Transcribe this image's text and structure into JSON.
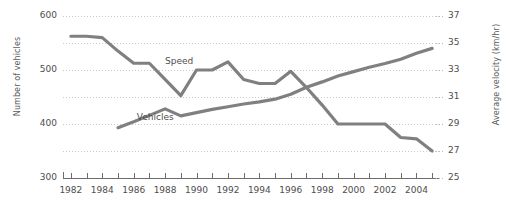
{
  "chart_data": {
    "type": "line",
    "title": "",
    "xlabel": "",
    "ylabel": "Number of vehicles",
    "y2label": "Average velocity (km/hr)",
    "grid": true,
    "legend_position": "inline-labels",
    "xlim": [
      1981.5,
      2005.5
    ],
    "ylim": [
      300,
      600
    ],
    "y2lim": [
      25,
      37
    ],
    "x_tick_step": 1,
    "x_label_step": 2,
    "y_ticks": [
      300,
      400,
      500,
      600
    ],
    "y_gridlines": [
      350,
      400,
      450,
      500,
      550,
      600
    ],
    "y2_ticks": [
      25,
      27,
      29,
      31,
      33,
      35,
      37
    ],
    "x": [
      1982,
      1983,
      1984,
      1985,
      1986,
      1987,
      1988,
      1989,
      1990,
      1991,
      1992,
      1993,
      1994,
      1995,
      1996,
      1997,
      1998,
      1999,
      2000,
      2001,
      2002,
      2003,
      2004,
      2005
    ],
    "x_tick_labels": [
      "1982",
      "1984",
      "1986",
      "1988",
      "1990",
      "1992",
      "1994",
      "1996",
      "1998",
      "2000",
      "2002",
      "2004"
    ],
    "series": [
      {
        "name": "Vehicles",
        "axis": "left",
        "unit": "number of vehicles",
        "color": "#808080",
        "label_text": "Vehicles",
        "x": [
          1985,
          1986,
          1987,
          1988,
          1989,
          1990,
          1991,
          1992,
          1993,
          1994,
          1995,
          1996,
          1997,
          1998,
          1999,
          2000,
          2001,
          2002,
          2003,
          2004,
          2005
        ],
        "values": [
          393,
          404,
          416,
          428,
          415,
          421,
          427,
          432,
          437,
          441,
          446,
          455,
          468,
          478,
          489,
          497,
          505,
          512,
          520,
          531,
          540
        ]
      },
      {
        "name": "Speed",
        "axis": "right",
        "unit": "km/hr",
        "color": "#808080",
        "label_text": "Speed",
        "x": [
          1982,
          1983,
          1984,
          1985,
          1986,
          1987,
          1988,
          1989,
          1990,
          1991,
          1992,
          1993,
          1994,
          1995,
          1996,
          1997,
          1998,
          1999,
          2000,
          2001,
          2002,
          2003,
          2004,
          2005
        ],
        "values": [
          35.5,
          35.5,
          35.4,
          34.4,
          33.5,
          33.5,
          32.3,
          31.1,
          33.0,
          33.0,
          33.6,
          32.3,
          32.0,
          32.0,
          32.9,
          31.7,
          30.4,
          29.0,
          29.0,
          29.0,
          29.0,
          28.0,
          27.9,
          27.0
        ]
      }
    ],
    "annotations": [
      {
        "text": "Speed",
        "x": 1988.0,
        "y2": 33.6
      },
      {
        "text": "Vehicles",
        "x": 1986.2,
        "y": 411
      }
    ]
  }
}
